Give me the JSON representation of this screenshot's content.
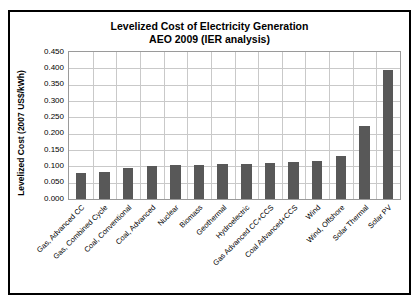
{
  "chart_data": {
    "type": "bar",
    "title": "Levelized Cost of Electricity Generation AEO 2009 (IER analysis)",
    "title_lines": [
      "Levelized Cost of Electricity Generation",
      "AEO 2009 (IER analysis)"
    ],
    "xlabel": "",
    "ylabel": "Levelized Cost (2007 US$/kWh)",
    "ylim": [
      0.0,
      0.45
    ],
    "ytick_step": 0.05,
    "ytick_labels": [
      "0.450",
      "0.400",
      "0.350",
      "0.300",
      "0.250",
      "0.200",
      "0.150",
      "0.100",
      "0.050",
      "0.000"
    ],
    "ytick_values": [
      0.45,
      0.4,
      0.35,
      0.3,
      0.25,
      0.2,
      0.15,
      0.1,
      0.05,
      0.0
    ],
    "grid": true,
    "legend": false,
    "bar_color": "#585858",
    "categories": [
      "Gas, Advanced CC",
      "Gas, Combined Cycle",
      "Coal, Conventional",
      "Coal, Advanced",
      "Nuclear",
      "Biomass",
      "Geothermal",
      "Hydroelectric",
      "Gas Advanced CC+CCS",
      "Coal Advanced+CCS",
      "Wind",
      "Wind, Offshore",
      "Solar Thermal",
      "Solar PV"
    ],
    "values": [
      0.079,
      0.083,
      0.094,
      0.1,
      0.104,
      0.104,
      0.107,
      0.108,
      0.11,
      0.113,
      0.116,
      0.131,
      0.224,
      0.258
    ],
    "values_full": [
      0.079,
      0.083,
      0.094,
      0.1,
      0.104,
      0.104,
      0.107,
      0.108,
      0.11,
      0.113,
      0.116,
      0.131,
      0.224,
      0.396
    ]
  },
  "colors": {
    "frame_border": "#000000",
    "gridline": "#c9c9c9",
    "plot_border": "#9a9a9a",
    "bar": "#585858",
    "text": "#000000",
    "background": "#ffffff"
  }
}
